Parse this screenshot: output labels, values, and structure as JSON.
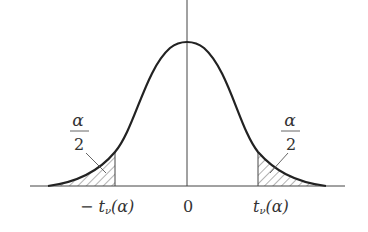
{
  "figure": {
    "center_label": "0",
    "left_cutoff_label": "− t",
    "left_cutoff_sub": "ν",
    "left_cutoff_arg": "(α)",
    "right_cutoff_label": "t",
    "right_cutoff_sub": "ν",
    "right_cutoff_arg": "(α)",
    "left_area_numerator": "α",
    "left_area_denominator": "2",
    "right_area_numerator": "α",
    "right_area_denominator": "2"
  }
}
